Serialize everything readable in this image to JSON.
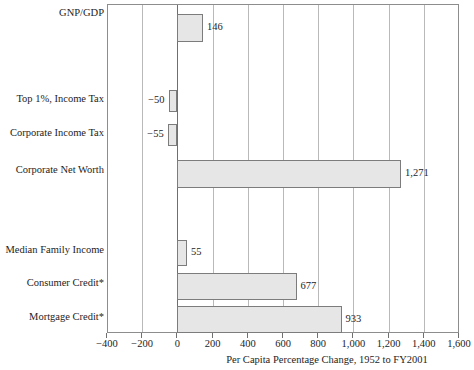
{
  "chart_data": {
    "type": "bar",
    "orientation": "horizontal",
    "title": "",
    "xlabel": "Per Capita Percentage Change, 1952 to FY2001",
    "ylabel": "",
    "xlim": [
      -400,
      1600
    ],
    "xticks": [
      -400,
      -200,
      0,
      200,
      400,
      600,
      800,
      1000,
      1200,
      1400,
      1600
    ],
    "xtick_labels": [
      "−400",
      "−200",
      "0",
      "200",
      "400",
      "600",
      "800",
      "1,000",
      "1,200",
      "1,400",
      "1,600"
    ],
    "grid": "vertical",
    "legend": "none",
    "categories": [
      "GNP/GDP",
      "",
      "Top 1%, Income Tax",
      "Corporate Income Tax",
      "Corporate Net Worth",
      "",
      "Median Family Income",
      "Consumer Credit*",
      "Mortgage Credit*"
    ],
    "values": [
      146,
      null,
      -50,
      -55,
      1271,
      null,
      55,
      677,
      933
    ],
    "value_labels": [
      "146",
      "",
      "−50",
      "−55",
      "1,271",
      "",
      "55",
      "677",
      "933"
    ],
    "bar_fill_color": "#e6e6e6",
    "bar_border_color": "#7c7c7c",
    "axis_color": "#8d8d8d",
    "gridline_color": "#b9b9b9",
    "text_color": "#1d1d1d"
  },
  "bars": [
    {
      "label": "GNP/GDP",
      "value": 146,
      "value_label": "146",
      "label_y": 13,
      "bar_top": 13,
      "bar_height": 28,
      "label_side": "right"
    },
    {
      "label": "Top 1%, Income Tax",
      "value": -50,
      "value_label": "−50",
      "label_y": 99,
      "bar_top": 89,
      "bar_height": 22,
      "label_side": "left"
    },
    {
      "label": "Corporate Income Tax",
      "value": -55,
      "value_label": "−55",
      "label_y": 133,
      "bar_top": 123,
      "bar_height": 22,
      "label_side": "left"
    },
    {
      "label": "Corporate Net Worth",
      "value": 1271,
      "value_label": "1,271",
      "label_y": 170,
      "bar_top": 159,
      "bar_height": 28,
      "label_side": "right"
    },
    {
      "label": "Median Family Income",
      "value": 55,
      "value_label": "55",
      "label_y": 250,
      "bar_top": 239,
      "bar_height": 26,
      "label_side": "right"
    },
    {
      "label": "Consumer Credit*",
      "value": 677,
      "value_label": "677",
      "label_y": 283,
      "bar_top": 272,
      "bar_height": 27,
      "label_side": "right"
    },
    {
      "label": "Mortgage Credit*",
      "value": 933,
      "value_label": "933",
      "label_y": 317,
      "bar_top": 305,
      "bar_height": 27,
      "label_side": "right"
    }
  ],
  "geometry": {
    "plot_left": 107,
    "plot_top": 4,
    "plot_width": 352,
    "plot_height": 329,
    "x_min": -400,
    "x_max": 1600
  }
}
